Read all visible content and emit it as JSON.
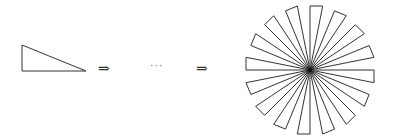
{
  "diagram": {
    "arrow_1": "⇒",
    "ellipsis": "···",
    "arrow_2": "⇒",
    "stroke_color": "#333333",
    "triangle_count": 16
  }
}
